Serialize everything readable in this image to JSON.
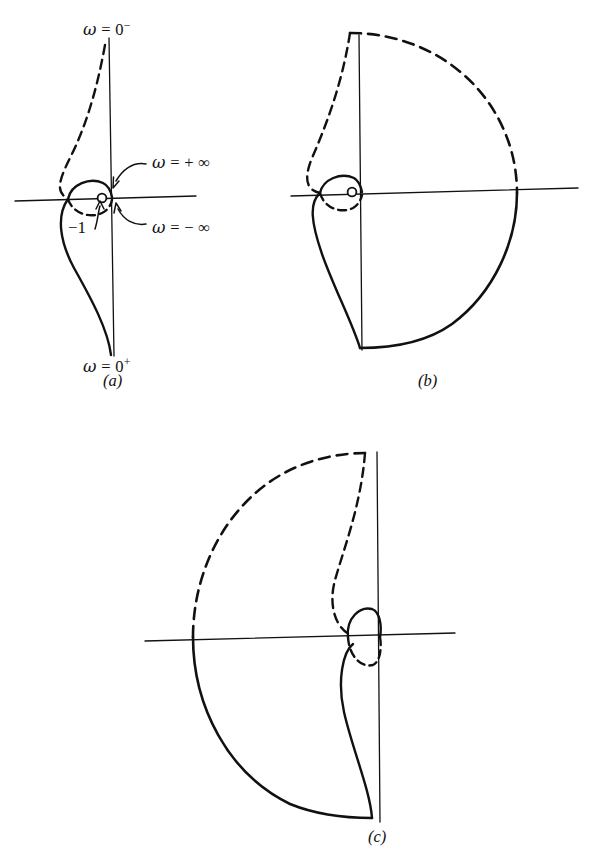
{
  "figure": {
    "background_color": "#ffffff",
    "ink_color": "#111111",
    "panels": [
      {
        "id": "a",
        "label": "(a)",
        "label_x": 110,
        "label_y": 382,
        "origin": {
          "x": 111,
          "y": 199
        },
        "minus_one": {
          "x": 68,
          "y": 199
        }
      },
      {
        "id": "b",
        "label": "(b)",
        "label_x": 425,
        "label_y": 382,
        "origin": {
          "x": 360,
          "y": 193
        },
        "minus_one": {
          "x": 320,
          "y": 193
        }
      },
      {
        "id": "c",
        "label": "(c)",
        "label_x": 375,
        "label_y": 838,
        "origin": {
          "x": 378,
          "y": 637
        },
        "minus_one": {
          "x": 345,
          "y": 637
        }
      }
    ],
    "annotations": [
      {
        "id": "omega-zero-minus",
        "text_plain": "ω = 0⁻",
        "var": "ω",
        "eq": " = 0",
        "sup": "−",
        "x": 83,
        "y": 22
      },
      {
        "id": "omega-zero-plus",
        "text_plain": "ω = 0⁺",
        "var": "ω",
        "eq": " = 0",
        "sup": "+",
        "x": 83,
        "y": 359
      },
      {
        "id": "omega-plus-infinity",
        "text_plain": "ω = + ∞",
        "var": "ω",
        "eq": " = + ∞",
        "sup": "",
        "x": 145,
        "y": 161
      },
      {
        "id": "omega-minus-infinity",
        "text_plain": "ω = − ∞",
        "var": "ω",
        "eq": " = − ∞",
        "sup": "",
        "x": 145,
        "y": 228
      },
      {
        "id": "minus-one-point",
        "text_plain": "−1",
        "var": "",
        "eq": "−1",
        "sup": "",
        "x": 71,
        "y": 228
      }
    ]
  },
  "chart_data": {
    "type": "line",
    "xlabel": "Real axis",
    "ylabel": "Imaginary axis",
    "grid": false,
    "legend": "none",
    "series": [
      {
        "name": "panel-a-solid-locus",
        "panel": "a",
        "style": "solid",
        "description": "Lower-half Nyquist locus from ω = 0⁺ up through the −1 point",
        "points": [
          [
            111,
            355
          ],
          [
            111,
            340
          ],
          [
            104,
            318
          ],
          [
            92,
            296
          ],
          [
            78,
            272
          ],
          [
            66,
            250
          ],
          [
            60,
            229
          ],
          [
            62,
            213
          ],
          [
            68,
            199
          ]
        ]
      },
      {
        "name": "panel-a-dashed-locus",
        "panel": "a",
        "style": "dashed",
        "description": "Upper-half mirror locus from ω = 0⁻ down to the −1 point",
        "points": [
          [
            105,
            45
          ],
          [
            99,
            70
          ],
          [
            90,
            100
          ],
          [
            78,
            131
          ],
          [
            66,
            158
          ],
          [
            58,
            176
          ],
          [
            58,
            190
          ],
          [
            68,
            199
          ]
        ]
      },
      {
        "name": "panel-a-solid-loop",
        "panel": "a",
        "style": "solid",
        "description": "Small solid loop from −1 to origin (ω → +∞)",
        "points": [
          [
            68,
            199
          ],
          [
            76,
            186
          ],
          [
            90,
            180
          ],
          [
            103,
            184
          ],
          [
            111,
            196
          ]
        ]
      },
      {
        "name": "panel-a-dashed-loop",
        "panel": "a",
        "style": "dashed",
        "description": "Small dashed loop from −1 to origin (ω → −∞)",
        "points": [
          [
            68,
            199
          ],
          [
            76,
            211
          ],
          [
            90,
            216
          ],
          [
            103,
            211
          ],
          [
            111,
            201
          ]
        ]
      },
      {
        "name": "panel-b-solid-arc",
        "panel": "b",
        "style": "solid",
        "description": "Large solid semicircular arc to the right, radius ~157",
        "points": [
          [
            517,
            193
          ],
          [
            512,
            230
          ],
          [
            495,
            272
          ],
          [
            468,
            308
          ],
          [
            432,
            333
          ],
          [
            395,
            346
          ],
          [
            360,
            348
          ]
        ]
      },
      {
        "name": "panel-b-dashed-arc",
        "panel": "b",
        "style": "dashed",
        "description": "Large dashed semicircular arc to the right, upper half",
        "points": [
          [
            350,
            33
          ],
          [
            395,
            36
          ],
          [
            437,
            55
          ],
          [
            477,
            88
          ],
          [
            503,
            130
          ],
          [
            516,
            170
          ],
          [
            517,
            193
          ]
        ]
      },
      {
        "name": "panel-b-solid-locus",
        "panel": "b",
        "style": "solid",
        "description": "Lower solid locus from bottom vertical back to −1",
        "points": [
          [
            360,
            348
          ],
          [
            353,
            330
          ],
          [
            342,
            305
          ],
          [
            330,
            278
          ],
          [
            320,
            250
          ],
          [
            314,
            225
          ],
          [
            314,
            207
          ],
          [
            320,
            193
          ]
        ]
      },
      {
        "name": "panel-b-dashed-locus",
        "panel": "b",
        "style": "dashed",
        "description": "Upper dashed locus from top vertical down to −1",
        "points": [
          [
            350,
            33
          ],
          [
            344,
            62
          ],
          [
            334,
            95
          ],
          [
            322,
            128
          ],
          [
            312,
            158
          ],
          [
            307,
            177
          ],
          [
            309,
            188
          ],
          [
            320,
            193
          ]
        ]
      },
      {
        "name": "panel-b-solid-loop",
        "panel": "b",
        "style": "solid",
        "description": "Small solid loop, −1 to origin",
        "points": [
          [
            320,
            193
          ],
          [
            327,
            180
          ],
          [
            341,
            175
          ],
          [
            354,
            179
          ],
          [
            361,
            190
          ]
        ]
      },
      {
        "name": "panel-b-dashed-loop",
        "panel": "b",
        "style": "dashed",
        "description": "Small dashed loop, −1 to origin",
        "points": [
          [
            320,
            193
          ],
          [
            327,
            205
          ],
          [
            341,
            210
          ],
          [
            354,
            205
          ],
          [
            361,
            196
          ]
        ]
      },
      {
        "name": "panel-c-solid-arc",
        "panel": "c",
        "style": "solid",
        "description": "Large solid arc sweeping left and down, radius ~185",
        "points": [
          [
            193,
            637
          ],
          [
            196,
            676
          ],
          [
            208,
            718
          ],
          [
            231,
            757
          ],
          [
            262,
            789
          ],
          [
            301,
            810
          ],
          [
            340,
            818
          ],
          [
            372,
            818
          ]
        ]
      },
      {
        "name": "panel-c-dashed-arc",
        "panel": "c",
        "style": "dashed",
        "description": "Large dashed arc sweeping left and up",
        "points": [
          [
            193,
            637
          ],
          [
            196,
            596
          ],
          [
            210,
            552
          ],
          [
            236,
            512
          ],
          [
            270,
            480
          ],
          [
            310,
            460
          ],
          [
            348,
            453
          ],
          [
            365,
            453
          ]
        ]
      },
      {
        "name": "panel-c-solid-locus",
        "panel": "c",
        "style": "solid",
        "description": "Inner solid locus from bottom vertical up to the small loop",
        "points": [
          [
            372,
            818
          ],
          [
            372,
            800
          ],
          [
            368,
            770
          ],
          [
            358,
            737
          ],
          [
            348,
            706
          ],
          [
            342,
            680
          ],
          [
            344,
            658
          ],
          [
            352,
            645
          ]
        ]
      },
      {
        "name": "panel-c-dashed-locus",
        "panel": "c",
        "style": "dashed",
        "description": "Inner dashed locus from top vertical down to the small loop",
        "points": [
          [
            365,
            453
          ],
          [
            363,
            484
          ],
          [
            356,
            518
          ],
          [
            344,
            552
          ],
          [
            335,
            583
          ],
          [
            333,
            607
          ],
          [
            339,
            626
          ],
          [
            349,
            634
          ]
        ]
      },
      {
        "name": "panel-c-solid-loop",
        "panel": "c",
        "style": "solid",
        "description": "Small solid loop upper half between −1 and origin",
        "points": [
          [
            348,
            637
          ],
          [
            350,
            620
          ],
          [
            362,
            610
          ],
          [
            375,
            613
          ],
          [
            380,
            628
          ],
          [
            379,
            637
          ]
        ]
      },
      {
        "name": "panel-c-dashed-loop",
        "panel": "c",
        "style": "dashed",
        "description": "Small dashed loop lower half between −1 and origin",
        "points": [
          [
            348,
            637
          ],
          [
            351,
            653
          ],
          [
            363,
            663
          ],
          [
            375,
            660
          ],
          [
            380,
            648
          ],
          [
            379,
            637
          ]
        ]
      }
    ],
    "axes": [
      {
        "panel": "a",
        "orientation": "horizontal",
        "x1": 15,
        "y1": 201,
        "x2": 196,
        "y2": 196
      },
      {
        "panel": "a",
        "orientation": "vertical",
        "x1": 109,
        "y1": 38,
        "x2": 114,
        "y2": 356
      },
      {
        "panel": "b",
        "orientation": "horizontal",
        "x1": 291,
        "y1": 196,
        "x2": 578,
        "y2": 188
      },
      {
        "panel": "b",
        "orientation": "vertical",
        "x1": 359,
        "y1": 35,
        "x2": 362,
        "y2": 350
      },
      {
        "panel": "c",
        "orientation": "horizontal",
        "x1": 145,
        "y1": 641,
        "x2": 455,
        "y2": 633
      },
      {
        "panel": "c",
        "orientation": "vertical",
        "x1": 377,
        "y1": 452,
        "x2": 380,
        "y2": 822
      }
    ]
  }
}
